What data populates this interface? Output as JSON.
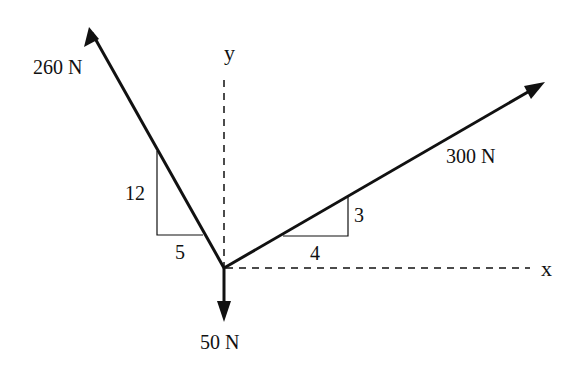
{
  "diagram": {
    "type": "free-body force diagram",
    "axes": {
      "x_label": "x",
      "y_label": "y"
    },
    "forces": [
      {
        "id": "f260",
        "label": "260 N",
        "slope_rise": "12",
        "slope_run": "5",
        "direction": "up-left"
      },
      {
        "id": "f300",
        "label": "300 N",
        "slope_rise": "3",
        "slope_run": "4",
        "direction": "up-right"
      },
      {
        "id": "f50",
        "label": "50 N",
        "direction": "down"
      }
    ],
    "colors": {
      "line": "#111111",
      "background": "#ffffff"
    }
  }
}
